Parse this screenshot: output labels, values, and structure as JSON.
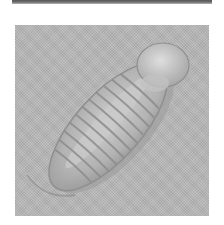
{
  "image": {
    "subject": "enrolled trilobite fossil",
    "description": "Grayscale photograph of a curled trilobite fossil with segmented thorax and rounded cephalon on textured matrix",
    "colors": {
      "background": "#ffffff",
      "matrix": "#b9b9b9",
      "fossil_light": "#d6d6d6",
      "fossil_shadow": "#8a8a8a",
      "top_band": "#666666"
    }
  }
}
